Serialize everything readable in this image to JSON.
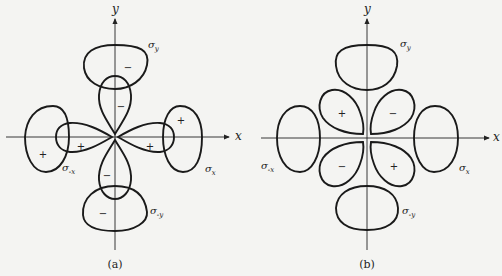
{
  "panels": [
    {
      "id": "a",
      "caption": "(a)",
      "x_axis_label": "x",
      "y_axis_label": "y",
      "orbital_labels": {
        "sigma_y": "σ",
        "sigma_y_sub": "y",
        "sigma_x": "σ",
        "sigma_x_sub": "x",
        "sigma_neg_x": "σ",
        "sigma_neg_x_sub": "-x",
        "sigma_neg_y": "σ",
        "sigma_neg_y_sub": "-y"
      },
      "signs": {
        "sigma_y_lobe": "−",
        "p_up": "−",
        "p_down": "−",
        "p_left": "+",
        "p_right": "+",
        "sigma_x_lobe": "+",
        "sigma_neg_x_lobe": "+",
        "sigma_neg_y_lobe": "−"
      }
    },
    {
      "id": "b",
      "caption": "(b)",
      "x_axis_label": "x",
      "y_axis_label": "y",
      "orbital_labels": {
        "sigma_y": "σ",
        "sigma_y_sub": "y",
        "sigma_x": "σ",
        "sigma_x_sub": "x",
        "sigma_neg_x": "σ",
        "sigma_neg_x_sub": "-x",
        "sigma_neg_y": "σ",
        "sigma_neg_y_sub": "-y"
      },
      "signs": {
        "d_upper_left": "+",
        "d_upper_right": "−",
        "d_lower_left": "−",
        "d_lower_right": "+"
      }
    }
  ]
}
